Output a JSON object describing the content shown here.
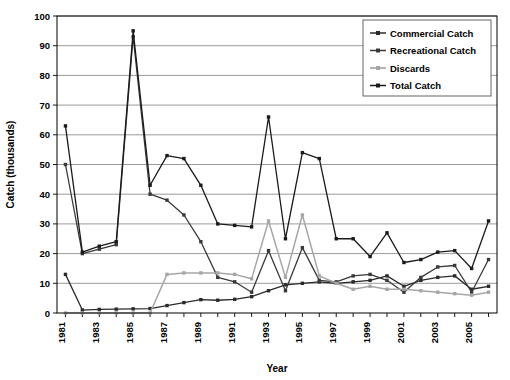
{
  "chart_data": {
    "type": "line",
    "title": "",
    "xlabel": "Year",
    "ylabel": "Catch (thousands)",
    "ylim": [
      0,
      100
    ],
    "ytick_step": 10,
    "yticks": [
      0,
      10,
      20,
      30,
      40,
      50,
      60,
      70,
      80,
      90,
      100
    ],
    "grid": true,
    "legend_position": "top-right",
    "categories": [
      "1981",
      "1982",
      "1983",
      "1984",
      "1985",
      "1986",
      "1987",
      "1988",
      "1989",
      "1990",
      "1991",
      "1992",
      "1993",
      "1994",
      "1995",
      "1996",
      "1997",
      "1998",
      "1999",
      "2000",
      "2001",
      "2002",
      "2003",
      "2004",
      "2005",
      "2006"
    ],
    "tick_labels": [
      "1981",
      "",
      "1983",
      "",
      "1985",
      "",
      "1987",
      "",
      "1989",
      "",
      "1991",
      "",
      "1993",
      "",
      "1995",
      "",
      "1997",
      "",
      "1999",
      "",
      "2001",
      "",
      "2003",
      "",
      "2005",
      ""
    ],
    "series": [
      {
        "name": "Commercial Catch",
        "color": "#2b2b2b",
        "values": [
          13,
          1,
          1.2,
          1.3,
          1.4,
          1.5,
          2.5,
          3.5,
          4.5,
          4.3,
          4.6,
          5.5,
          7.5,
          9.5,
          10,
          10.5,
          10,
          10.5,
          11,
          12.5,
          9,
          11,
          12,
          12.5,
          8,
          9
        ]
      },
      {
        "name": "Recreational Catch",
        "color": "#3a3a3a",
        "values": [
          50,
          20,
          21.5,
          23,
          93,
          40,
          38,
          33,
          24,
          12,
          10.5,
          7,
          21,
          7.5,
          22,
          11,
          10.5,
          12.5,
          13,
          11,
          7,
          12,
          15.5,
          16,
          7,
          18
        ]
      },
      {
        "name": "Discards",
        "color": "#a6a6a6",
        "values": [
          0,
          0,
          0,
          0,
          0,
          0,
          13,
          13.5,
          13.5,
          13.5,
          13,
          11.5,
          31,
          12,
          33,
          12.5,
          10,
          8,
          9,
          8,
          8,
          7.5,
          7,
          6.5,
          6,
          7
        ]
      },
      {
        "name": "Total Catch",
        "color": "#1a1a1a",
        "values": [
          63,
          20.5,
          22.5,
          24,
          95,
          43,
          53,
          52,
          43,
          30,
          29.5,
          29,
          66,
          25,
          54,
          52,
          25,
          25,
          19,
          27,
          17,
          18,
          20.5,
          21,
          15,
          31
        ]
      }
    ]
  },
  "legend": {
    "items": [
      "Commercial Catch",
      "Recreational Catch",
      "Discards",
      "Total Catch"
    ]
  }
}
